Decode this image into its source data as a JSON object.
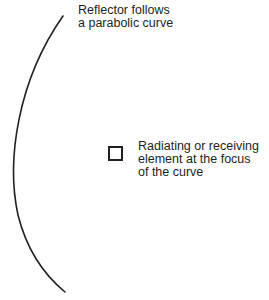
{
  "diagram": {
    "reflector_label": {
      "lines": [
        "Reflector follows",
        "a parabolic curve"
      ]
    },
    "element_label": {
      "lines": [
        "Radiating or receiving",
        "element at the focus",
        "of the curve"
      ]
    },
    "colors": {
      "stroke": "#231f20",
      "background": "#ffffff"
    }
  }
}
